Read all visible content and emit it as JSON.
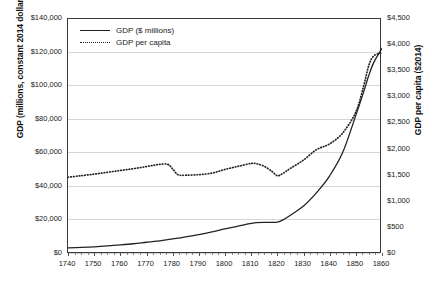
{
  "chart_data": {
    "type": "line",
    "title": "",
    "xlabel": "",
    "ylabel": "GDP (millions, constant 2014 dollars)",
    "y2label": "GDP per capita ($2014)",
    "grid": true,
    "legend_position": "top-left",
    "xlim": [
      1740,
      1860
    ],
    "ylim": [
      0,
      140000
    ],
    "y2lim": [
      0,
      4500
    ],
    "xticks": [
      1740,
      1750,
      1760,
      1770,
      1780,
      1790,
      1800,
      1810,
      1820,
      1830,
      1840,
      1850,
      1860
    ],
    "xtick_labels": [
      "1740",
      "1750",
      "1760",
      "1770",
      "1780",
      "1790",
      "1800",
      "1810",
      "1820",
      "1830",
      "1840",
      "1850",
      "1860"
    ],
    "yticks": [
      0,
      20000,
      40000,
      60000,
      80000,
      100000,
      120000,
      140000
    ],
    "ytick_labels": [
      "$0",
      "$20,000",
      "$40,000",
      "$60,000",
      "$80,000",
      "$100,000",
      "$120,000",
      "$140,000"
    ],
    "y2ticks": [
      0,
      500,
      1000,
      1500,
      2000,
      2500,
      3000,
      3500,
      4000,
      4500
    ],
    "y2tick_labels": [
      "$0",
      "$500",
      "$1,000",
      "$1,500",
      "$2,000",
      "$2,500",
      "$3,000",
      "$3,500",
      "$4,000",
      "$4,500"
    ],
    "x": [
      1740,
      1745,
      1750,
      1755,
      1760,
      1765,
      1770,
      1774,
      1778,
      1780,
      1782,
      1785,
      1790,
      1795,
      1800,
      1805,
      1810,
      1812,
      1815,
      1818,
      1820,
      1822,
      1825,
      1830,
      1835,
      1840,
      1845,
      1850,
      1853,
      1855,
      1857,
      1860
    ],
    "series": [
      {
        "name": "GDP ($ millions)",
        "axis": "left",
        "style": "solid",
        "color": "#222222",
        "values": [
          3000,
          3300,
          3700,
          4200,
          4800,
          5500,
          6400,
          7100,
          8000,
          8400,
          8800,
          9600,
          11000,
          12600,
          14400,
          16000,
          17600,
          18100,
          18300,
          18200,
          18400,
          19600,
          22500,
          28000,
          36000,
          46000,
          60000,
          82000,
          96000,
          106000,
          114000,
          122000
        ]
      },
      {
        "name": "GDP per capita",
        "axis": "right",
        "style": "dotted",
        "color": "#222222",
        "values": [
          1450,
          1480,
          1510,
          1545,
          1580,
          1615,
          1655,
          1690,
          1700,
          1610,
          1500,
          1490,
          1500,
          1530,
          1600,
          1660,
          1715,
          1710,
          1660,
          1560,
          1480,
          1520,
          1620,
          1780,
          1980,
          2090,
          2300,
          2700,
          3200,
          3600,
          3780,
          3830
        ]
      }
    ]
  },
  "legend": {
    "items": [
      {
        "label": "GDP ($ millions)",
        "style": "solid"
      },
      {
        "label": "GDP per capita",
        "style": "dotted"
      }
    ]
  }
}
